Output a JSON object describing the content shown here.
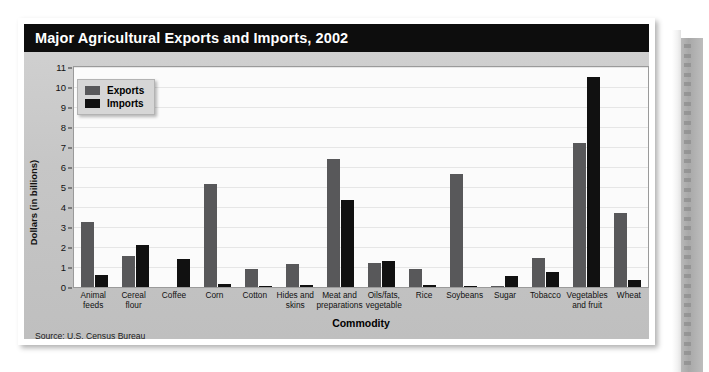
{
  "card": {
    "title": "Major Agricultural Exports and Imports, 2002",
    "source": "Source: U.S. Census Bureau"
  },
  "legend": {
    "exports_label": "Exports",
    "imports_label": "Imports"
  },
  "colors": {
    "exports": "#58585a",
    "imports": "#111111",
    "title_bar": "#0d0d0d",
    "card_body": "#c6c6c6",
    "plot_bg": "#fbfbfb"
  },
  "chart_data": {
    "type": "bar",
    "title": "Major Agricultural Exports and Imports, 2002",
    "xlabel": "Commodity",
    "ylabel": "Dollars (in billions)",
    "ylim": [
      0,
      11
    ],
    "yticks": [
      0,
      1,
      2,
      3,
      4,
      5,
      6,
      7,
      8,
      9,
      10,
      11
    ],
    "grid": true,
    "legend_position": "upper-left-inside",
    "categories": [
      "Animal feeds",
      "Cereal flour",
      "Coffee",
      "Corn",
      "Cotton",
      "Hides and skins",
      "Meat and preparations",
      "Oils/fats, vegetable",
      "Rice",
      "Soybeans",
      "Sugar",
      "Tobacco",
      "Vegetables and fruit",
      "Wheat"
    ],
    "series": [
      {
        "name": "Exports",
        "values": [
          3.25,
          1.55,
          0.0,
          5.15,
          0.9,
          1.15,
          6.4,
          1.2,
          0.9,
          5.65,
          0.05,
          1.45,
          7.2,
          3.7
        ]
      },
      {
        "name": "Imports",
        "values": [
          0.6,
          2.1,
          1.4,
          0.15,
          0.05,
          0.1,
          4.35,
          1.3,
          0.1,
          0.05,
          0.55,
          0.75,
          10.5,
          0.35
        ]
      }
    ]
  }
}
